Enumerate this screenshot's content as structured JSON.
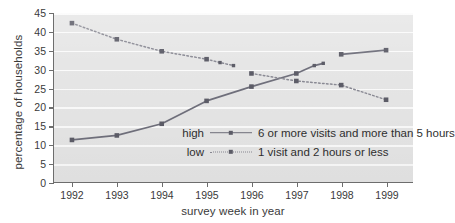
{
  "chart_data": {
    "type": "line",
    "title": "",
    "xlabel": "survey week in year",
    "ylabel": "percentage of households",
    "categories": [
      "1992",
      "1993",
      "1994",
      "1995",
      "1996",
      "1997",
      "1998",
      "1999"
    ],
    "x": [
      1992,
      1993,
      1994,
      1995,
      1996,
      1997,
      1998,
      1999
    ],
    "xlim": [
      1991.6,
      1999.6
    ],
    "ylim": [
      0,
      45
    ],
    "yticks": [
      0,
      5,
      10,
      15,
      20,
      25,
      30,
      35,
      40,
      45
    ],
    "grid": "horizontal",
    "legend_position": "inside-center",
    "series": [
      {
        "name": "high",
        "label": "6 or more visits and more than 5 hours",
        "style": "solid",
        "color": "#70707c",
        "values": [
          11.2,
          12.4,
          15.5,
          21.6,
          25.4,
          28.9,
          34.0,
          35.1
        ],
        "extra_points": [
          {
            "x": 1997.4,
            "y": 31.0
          },
          {
            "x": 1997.6,
            "y": 31.6
          }
        ],
        "break_between": [
          "1997",
          "1998"
        ]
      },
      {
        "name": "low",
        "label": "1 visit and 2 hours or less",
        "style": "dotted",
        "color": "#8a8a94",
        "values": [
          42.3,
          38.0,
          34.8,
          32.7,
          28.9,
          26.9,
          25.8,
          21.9
        ],
        "extra_points": [
          {
            "x": 1995.3,
            "y": 31.8
          },
          {
            "x": 1995.6,
            "y": 31.0
          }
        ],
        "break_between": [
          "1995",
          "1996"
        ]
      }
    ]
  },
  "legend": {
    "rows": [
      {
        "key": "high",
        "style": "solid",
        "text": "6 or more visits and more than 5 hours"
      },
      {
        "key": "low",
        "style": "dotted",
        "text": "1 visit and 2 hours or less"
      }
    ]
  },
  "colors": {
    "plot_background": "#e6e6e6",
    "gridline": "#fbfbfb",
    "axis": "#6d6d6d",
    "series_high": "#70707c",
    "series_low": "#8a8a94",
    "marker": "#5d5d68",
    "text": "#3a3a3a"
  }
}
